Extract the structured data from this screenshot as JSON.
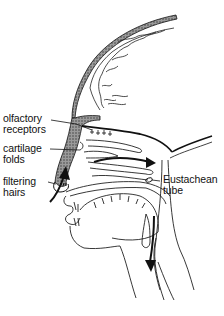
{
  "diagram": {
    "labels": [
      {
        "id": "olfactory",
        "line1": "olfactory",
        "line2": "receptors"
      },
      {
        "id": "cartilage",
        "line1": "cartilage",
        "line2": "folds"
      },
      {
        "id": "filtering",
        "line1": "filtering",
        "line2": "hairs"
      },
      {
        "id": "eustachean",
        "line1": "Eustachean",
        "line2": "tube"
      }
    ],
    "colors": {
      "ink": "#111111",
      "stipple": "#6a6a6a",
      "background": "#ffffff"
    }
  }
}
